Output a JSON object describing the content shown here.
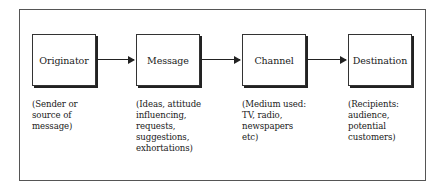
{
  "diagram": {
    "type": "flow",
    "nodes": [
      {
        "id": "originator",
        "label": "Originator",
        "description": "(Sender or\nsource of\nmessage)"
      },
      {
        "id": "message",
        "label": "Message",
        "description": "(Ideas, attitude\ninfluencing,\nrequests,\nsuggestions,\nexhortations)"
      },
      {
        "id": "channel",
        "label": "Channel",
        "description": "(Medium used:\nTV, radio,\nnewspapers\netc)"
      },
      {
        "id": "destination",
        "label": "Destination",
        "description": "(Recipients:\naudience,\npotential\ncustomers)"
      }
    ],
    "edges": [
      {
        "from": "originator",
        "to": "message"
      },
      {
        "from": "message",
        "to": "channel"
      },
      {
        "from": "channel",
        "to": "destination"
      }
    ]
  }
}
